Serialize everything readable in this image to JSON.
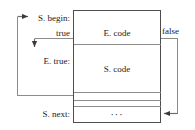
{
  "diagram": {
    "type": "control-flow-layout",
    "colors": {
      "stroke": "#4d4d4d",
      "text": "#1a1a1a",
      "background": "#ffffff"
    },
    "labels": {
      "s_begin": "S. begin:",
      "true_branch": "true",
      "e_true": "E. true:",
      "s_next": "S. next:",
      "e_code": "E. code",
      "s_code": "S. code",
      "ellipsis": "···",
      "false_branch": "false"
    },
    "blocks": [
      {
        "name": "E. code",
        "label": "E. code"
      },
      {
        "name": "S. code",
        "label": "S. code"
      },
      {
        "name": "continuation",
        "label": "···"
      }
    ],
    "edges": [
      {
        "name": "true-edge",
        "label": "true",
        "from": "E. code",
        "to": "E. true:"
      },
      {
        "name": "false-edge",
        "label": "false",
        "from": "E. code",
        "to": "S. next:"
      },
      {
        "name": "loop-back-edge",
        "label": "",
        "from": "S. code",
        "to": "S. begin:"
      }
    ]
  }
}
